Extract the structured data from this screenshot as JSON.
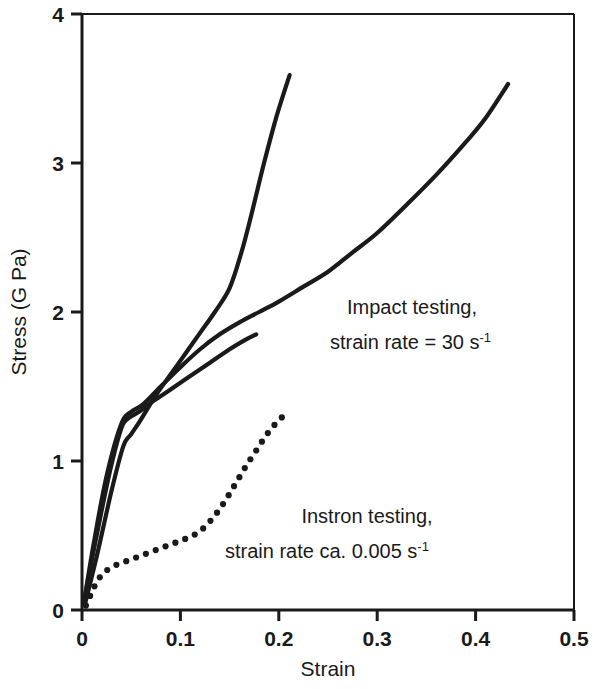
{
  "chart_data": {
    "type": "line",
    "title": "",
    "xlabel": "Strain",
    "ylabel": "Stress (G Pa)",
    "xlim": [
      0,
      0.5
    ],
    "ylim": [
      0,
      4
    ],
    "xticks": [
      "0",
      "0.1",
      "0.2",
      "0.3",
      "0.4",
      "0.5"
    ],
    "xtick_values": [
      0,
      0.1,
      0.2,
      0.3,
      0.4,
      0.5
    ],
    "yticks": [
      "0",
      "1",
      "2",
      "3",
      "4"
    ],
    "ytick_values": [
      0,
      1,
      2,
      3,
      4
    ],
    "grid": false,
    "legend": "none",
    "line_color": "#1a1a1a",
    "series": [
      {
        "name": "Impact testing long curve",
        "style": "solid",
        "x": [
          0.002,
          0.012,
          0.025,
          0.04,
          0.05,
          0.062,
          0.08,
          0.1,
          0.12,
          0.14,
          0.16,
          0.18,
          0.2,
          0.225,
          0.25,
          0.275,
          0.3,
          0.33,
          0.36,
          0.39,
          0.41,
          0.433
        ],
        "y": [
          0.05,
          0.45,
          0.9,
          1.25,
          1.33,
          1.38,
          1.5,
          1.63,
          1.75,
          1.85,
          1.93,
          2.0,
          2.07,
          2.17,
          2.27,
          2.4,
          2.53,
          2.72,
          2.92,
          3.14,
          3.3,
          3.53
        ]
      },
      {
        "name": "Impact testing steep curve",
        "style": "solid",
        "x": [
          0.003,
          0.015,
          0.03,
          0.042,
          0.05,
          0.06,
          0.075,
          0.09,
          0.105,
          0.12,
          0.135,
          0.15,
          0.162,
          0.172,
          0.185,
          0.198,
          0.211
        ],
        "y": [
          0.04,
          0.36,
          0.8,
          1.1,
          1.18,
          1.28,
          1.44,
          1.58,
          1.72,
          1.86,
          2.0,
          2.16,
          2.4,
          2.65,
          3.0,
          3.32,
          3.59
        ]
      },
      {
        "name": "Impact testing short curve",
        "style": "solid",
        "x": [
          0.002,
          0.014,
          0.028,
          0.04,
          0.048,
          0.058,
          0.072,
          0.09,
          0.11,
          0.13,
          0.15,
          0.165,
          0.177
        ],
        "y": [
          0.06,
          0.47,
          0.92,
          1.22,
          1.29,
          1.33,
          1.4,
          1.48,
          1.57,
          1.66,
          1.75,
          1.81,
          1.85
        ]
      },
      {
        "name": "Instron testing",
        "style": "dotted",
        "x": [
          0.004,
          0.01,
          0.016,
          0.024,
          0.034,
          0.046,
          0.058,
          0.07,
          0.082,
          0.094,
          0.106,
          0.118,
          0.128,
          0.138,
          0.148,
          0.158,
          0.168,
          0.178,
          0.188,
          0.198,
          0.206
        ],
        "y": [
          0.03,
          0.12,
          0.2,
          0.26,
          0.3,
          0.33,
          0.36,
          0.39,
          0.42,
          0.45,
          0.48,
          0.52,
          0.58,
          0.66,
          0.76,
          0.87,
          0.98,
          1.08,
          1.18,
          1.26,
          1.31
        ]
      }
    ],
    "annotations": [
      {
        "id": "impact",
        "line1": "Impact testing,",
        "line2_a": "strain rate = 30 s",
        "line2_sup": "-1",
        "x": 0.335,
        "y": 2.06
      },
      {
        "id": "instron",
        "line1": "Instron testing,",
        "line2_a": "strain rate ca. 0.005 s",
        "line2_sup": "-1",
        "x": 0.255,
        "y": 0.7
      }
    ]
  }
}
